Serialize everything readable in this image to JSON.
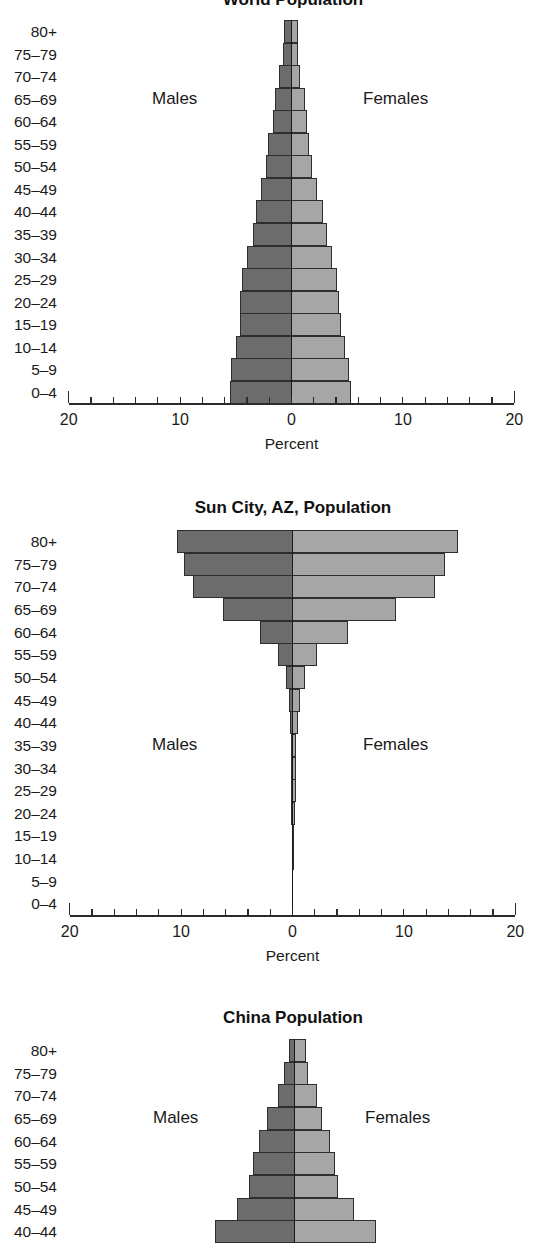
{
  "age_groups": [
    "80+",
    "75–79",
    "70–74",
    "65–69",
    "60–64",
    "55–59",
    "50–54",
    "45–49",
    "40–44",
    "35–39",
    "30–34",
    "25–29",
    "20–24",
    "15–19",
    "10–14",
    "5–9",
    "0–4"
  ],
  "colors": {
    "male": "#6c6c6c",
    "female": "#a6a6a6",
    "outline": "#2e2e2e"
  },
  "chart_data": [
    {
      "type": "bar",
      "orientation": "horizontal-population-pyramid",
      "title": "World Population",
      "xlabel": "Percent",
      "ylabel": "",
      "xlim": [
        -20,
        20
      ],
      "x_tick_labels": [
        "20",
        "10",
        "0",
        "10",
        "20"
      ],
      "x_minor_tick_step": 2,
      "side_labels": {
        "left": "Males",
        "right": "Females"
      },
      "side_label_row": "65–69",
      "categories": [
        "80+",
        "75–79",
        "70–74",
        "65–69",
        "60–64",
        "55–59",
        "50–54",
        "45–49",
        "40–44",
        "35–39",
        "30–34",
        "25–29",
        "20–24",
        "15–19",
        "10–14",
        "5–9",
        "0–4"
      ],
      "series": [
        {
          "name": "Males",
          "values": [
            0.7,
            0.8,
            1.1,
            1.5,
            1.7,
            2.1,
            2.3,
            2.7,
            3.2,
            3.5,
            4.0,
            4.4,
            4.6,
            4.6,
            5.0,
            5.4,
            5.5
          ]
        },
        {
          "name": "Females",
          "values": [
            0.55,
            0.55,
            0.8,
            1.2,
            1.4,
            1.6,
            1.8,
            2.3,
            2.8,
            3.2,
            3.65,
            4.1,
            4.3,
            4.4,
            4.8,
            5.2,
            5.3
          ]
        }
      ],
      "grid": false,
      "legend": "none"
    },
    {
      "type": "bar",
      "orientation": "horizontal-population-pyramid",
      "title": "Sun City, AZ, Population",
      "xlabel": "Percent",
      "ylabel": "",
      "xlim": [
        -20,
        20
      ],
      "x_tick_labels": [
        "20",
        "10",
        "0",
        "10",
        "20"
      ],
      "x_minor_tick_step": 2,
      "side_labels": {
        "left": "Males",
        "right": "Females"
      },
      "side_label_row": "35–39",
      "categories": [
        "80+",
        "75–79",
        "70–74",
        "65–69",
        "60–64",
        "55–59",
        "50–54",
        "45–49",
        "40–44",
        "35–39",
        "30–34",
        "25–29",
        "20–24",
        "15–19",
        "10–14",
        "5–9",
        "0–4"
      ],
      "series": [
        {
          "name": "Males",
          "values": [
            10.4,
            9.7,
            8.9,
            6.2,
            2.9,
            1.3,
            0.55,
            0.3,
            0.25,
            0.15,
            0.12,
            0.12,
            0.1,
            0.08,
            0.03,
            0.01,
            0.01
          ]
        },
        {
          "name": "Females",
          "values": [
            14.9,
            13.7,
            12.8,
            9.3,
            5.0,
            2.2,
            1.1,
            0.65,
            0.5,
            0.35,
            0.3,
            0.3,
            0.25,
            0.15,
            0.05,
            0.02,
            0.02
          ]
        }
      ],
      "grid": false,
      "legend": "none"
    },
    {
      "type": "bar",
      "orientation": "horizontal-population-pyramid",
      "title": "China Population",
      "xlabel": "",
      "ylabel": "",
      "xlim": [
        -20,
        20
      ],
      "side_labels": {
        "left": "Males",
        "right": "Females"
      },
      "side_label_row": "65–69",
      "categories": [
        "80+",
        "75–79",
        "70–74",
        "65–69",
        "60–64",
        "55–59",
        "50–54",
        "45–49",
        "40–44"
      ],
      "series": [
        {
          "name": "Males",
          "values": [
            0.5,
            0.9,
            1.5,
            2.5,
            3.2,
            3.7,
            4.1,
            5.2,
            7.1
          ]
        },
        {
          "name": "Females",
          "values": [
            1.0,
            1.2,
            2.0,
            2.5,
            3.2,
            3.6,
            3.9,
            5.3,
            7.3
          ]
        }
      ],
      "note": "Chart is cut off at the bottom edge of the screenshot after the 40–44 row",
      "grid": false,
      "legend": "none"
    }
  ]
}
